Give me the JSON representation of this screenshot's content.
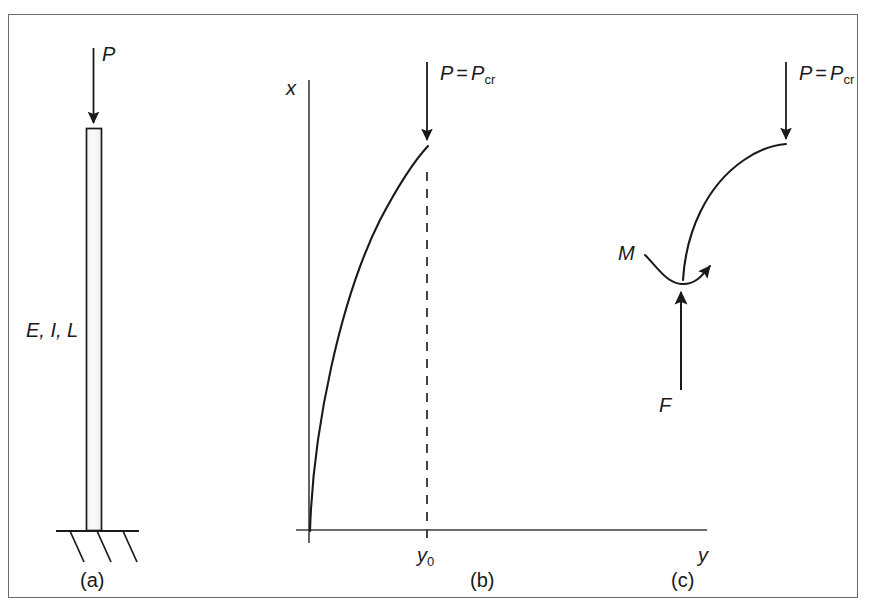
{
  "figure": {
    "background_color": "#ffffff",
    "frame_color": "#6b6b6b",
    "ink_color": "#1a1a1a",
    "panels": [
      {
        "id": "a",
        "caption": "(a)",
        "labels": [
          {
            "name": "load-P",
            "text": "P"
          },
          {
            "name": "properties",
            "text": "E, I, L"
          }
        ]
      },
      {
        "id": "b",
        "caption": "(b)",
        "labels": [
          {
            "name": "axis-x",
            "text": "x"
          },
          {
            "name": "axis-y",
            "text": "y"
          },
          {
            "name": "deflection",
            "text": "y",
            "subscript": "0"
          },
          {
            "name": "critical-load",
            "text": "P",
            "equals": "=",
            "text2": "P",
            "subscript": "cr"
          }
        ]
      },
      {
        "id": "c",
        "caption": "(c)",
        "labels": [
          {
            "name": "moment",
            "text": "M"
          },
          {
            "name": "force",
            "text": "F"
          },
          {
            "name": "critical-load",
            "text": "P",
            "equals": "=",
            "text2": "P",
            "subscript": "cr"
          }
        ]
      }
    ]
  },
  "panel_a": {
    "load_label": "P",
    "properties_label": "E, I, L",
    "caption": "(a)"
  },
  "panel_b": {
    "axis_x_label": "x",
    "axis_y_label": "y",
    "deflection_base": "y",
    "deflection_sub": "0",
    "load_P": "P",
    "load_eq": "=",
    "load_Pcr_base": "P",
    "load_Pcr_sub": "cr",
    "caption": "(b)"
  },
  "panel_c": {
    "moment_label": "M",
    "force_label": "F",
    "load_P": "P",
    "load_eq": "=",
    "load_Pcr_base": "P",
    "load_Pcr_sub": "cr",
    "caption": "(c)"
  }
}
